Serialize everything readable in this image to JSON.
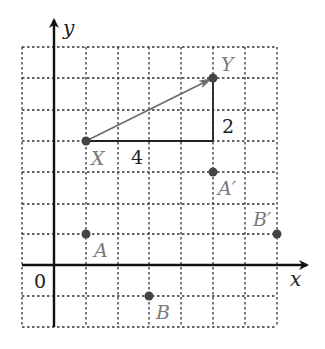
{
  "diagram": {
    "type": "coordinate-grid-translation",
    "axes": {
      "x_label": "x",
      "y_label": "y",
      "origin_label": "0"
    },
    "grid": {
      "x_range": [
        -1,
        7
      ],
      "y_range": [
        -2,
        7
      ],
      "style": "dotted"
    },
    "vector": {
      "from": "X",
      "to": "Y",
      "horizontal_component_label": "4",
      "vertical_component_label": "2"
    },
    "points": [
      {
        "label": "X",
        "x": 1,
        "y": 4
      },
      {
        "label": "Y",
        "x": 5,
        "y": 6
      },
      {
        "label": "A",
        "x": 1,
        "y": 1
      },
      {
        "label": "B",
        "x": 3,
        "y": -1
      },
      {
        "label": "A′",
        "x": 5,
        "y": 3
      },
      {
        "label": "B′",
        "x": 7,
        "y": 1
      }
    ],
    "colors": {
      "grid": "#333333",
      "axes": "#111111",
      "vector": "#6e6e6e",
      "point": "#444444",
      "point_label": "#7a7a7a"
    }
  }
}
